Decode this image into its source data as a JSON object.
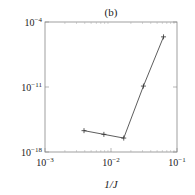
{
  "chart_data": {
    "type": "line",
    "title": "(b)",
    "xlabel": "1/J",
    "ylabel": "",
    "xscale": "log",
    "yscale": "log",
    "xlim_exp": [
      -3,
      -1
    ],
    "ylim_exp": [
      -18,
      -4
    ],
    "x_ticks": [
      {
        "exp": -3,
        "base": "10",
        "sup": "−3"
      },
      {
        "exp": -2,
        "base": "10",
        "sup": "−2"
      },
      {
        "exp": -1,
        "base": "10",
        "sup": "−1"
      }
    ],
    "y_ticks": [
      {
        "exp": -4,
        "base": "10",
        "sup": "−4"
      },
      {
        "exp": -11,
        "base": "10",
        "sup": "−11"
      },
      {
        "exp": -18,
        "base": "10",
        "sup": "−18"
      }
    ],
    "grid": false,
    "legend": "none",
    "series": [
      {
        "name": "error",
        "marker": "+",
        "color": "#333333",
        "x": [
          0.0039,
          0.0078,
          0.0156,
          0.031,
          0.0625
        ],
        "y_exp": [
          -15.7,
          -16.1,
          -16.5,
          -10.9,
          -5.6
        ]
      }
    ]
  }
}
